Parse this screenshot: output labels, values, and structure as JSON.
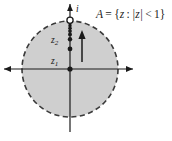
{
  "figure": {
    "set_label": {
      "full": "A = {z : |z| < 1}",
      "name": "A",
      "equals": "=",
      "open_brace": "{",
      "variable": "z",
      "colon": ":",
      "modulus": "|z|",
      "relation": "<",
      "bound": "1",
      "close_brace": "}"
    },
    "axes": {
      "real_axis_label": "",
      "imaginary_axis_label": "",
      "origin_label": "z1"
    },
    "points": [
      {
        "id": "z1",
        "label": "z",
        "subscript": "1",
        "value_y": 0.0,
        "filled": true
      },
      {
        "id": "z2",
        "label": "z",
        "subscript": "2",
        "value_y": 0.42,
        "filled": true
      },
      {
        "id": "p3",
        "label": "",
        "subscript": "",
        "value_y": 0.62,
        "filled": true
      },
      {
        "id": "p4",
        "label": "",
        "subscript": "",
        "value_y": 0.72,
        "filled": true
      },
      {
        "id": "p5",
        "label": "",
        "subscript": "",
        "value_y": 0.79,
        "filled": true
      },
      {
        "id": "p6",
        "label": "",
        "subscript": "",
        "value_y": 0.85,
        "filled": true
      },
      {
        "id": "p7",
        "label": "",
        "subscript": "",
        "value_y": 0.895,
        "filled": true
      },
      {
        "id": "i",
        "label": "i",
        "subscript": "",
        "value_y": 1.0,
        "filled": false
      }
    ],
    "disk": {
      "boundary_style": "dashed",
      "fill_color": "#cfcfcf",
      "stroke_color": "#3a3a3a",
      "radius_value": 1
    },
    "arrow": {
      "name": "convergence-arrow",
      "direction": "up"
    },
    "colors": {
      "ink": "#1a1a1a",
      "disk_fill": "#cfcfcf",
      "disk_stroke": "#3a3a3a",
      "background": "#ffffff"
    }
  }
}
